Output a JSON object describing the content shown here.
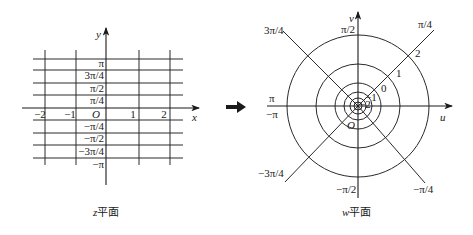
{
  "z_plane": {
    "x_axis_label": "x",
    "y_axis_label": "y",
    "origin_label": "O",
    "x_ticks": [
      "−2",
      "−1",
      "1",
      "2"
    ],
    "y_ticks_upper": [
      "π",
      "3π/4",
      "π/2",
      "π/4"
    ],
    "y_ticks_lower": [
      "−π/4",
      "−π/2",
      "−3π/4",
      "−π"
    ],
    "caption_var": "z",
    "caption_text": "平面"
  },
  "arrow": {
    "icon": "right-arrow-icon"
  },
  "w_plane": {
    "u_axis_label": "u",
    "v_axis_label": "v",
    "origin_label": "O",
    "angle_labels": {
      "top": "π/2",
      "top_right": "π/4",
      "top_left": "3π/4",
      "left_upper": "π",
      "left_lower": "−π",
      "bottom_left": "−3π/4",
      "bottom": "−π/2",
      "bottom_right": "−π/4"
    },
    "circle_labels": [
      "2",
      "1",
      "0",
      "−1",
      "−2"
    ],
    "caption_var": "w",
    "caption_text": "平面"
  },
  "colors": {
    "line": "#2a2a2a",
    "background": "#ffffff"
  }
}
